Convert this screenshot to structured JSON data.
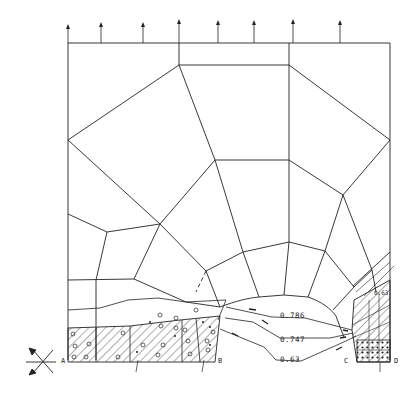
{
  "figure": {
    "type": "finite-element mesh with fracture/damage zones and contour lines",
    "colors": {
      "line": "#222222",
      "background": "#ffffff"
    }
  },
  "load": {
    "description": "upward arrows along top edge",
    "arrow_count": 8
  },
  "points": {
    "A": "A",
    "B": "B",
    "C": "C",
    "D": "D"
  },
  "contours": [
    {
      "id": "c1",
      "value": "0.786"
    },
    {
      "id": "c2",
      "value": "0.747"
    },
    {
      "id": "c3",
      "value": "0.63"
    }
  ],
  "zone_label": "0.63",
  "support_symbol": "roller/fixed support symbol"
}
